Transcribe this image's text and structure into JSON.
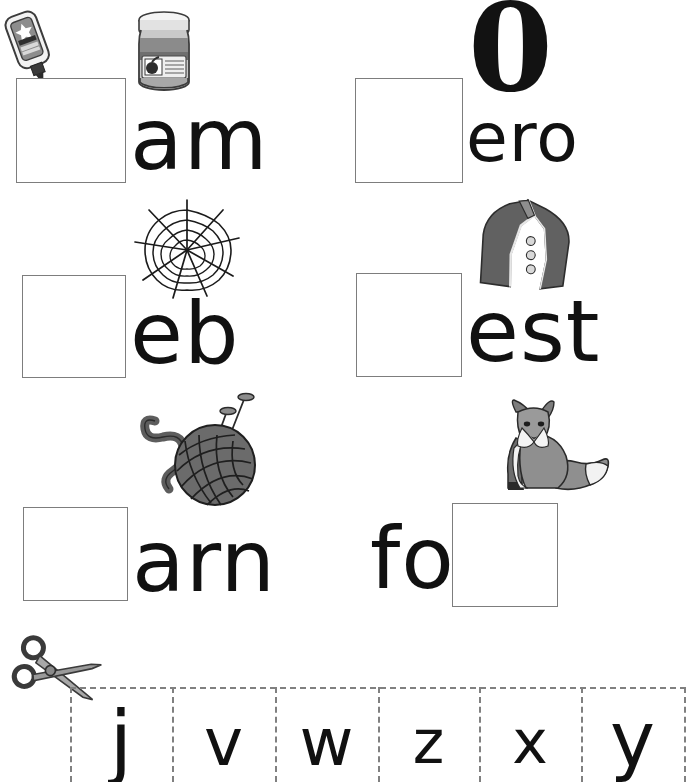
{
  "worksheet": {
    "title": "Beginning Sounds Cut and Paste Worksheet",
    "box_border_color": "#7d7d7d",
    "text_color": "#111111",
    "dash_color": "#808080"
  },
  "items": [
    {
      "id": "jam",
      "word_fragment": "am",
      "missing_letter": "j",
      "picture": "jam-jar",
      "second_picture": "glue-bottle",
      "box_position": "before"
    },
    {
      "id": "zero",
      "word_fragment": "ero",
      "missing_letter": "z",
      "picture": "number-zero",
      "big_glyph": "0",
      "box_position": "before"
    },
    {
      "id": "web",
      "word_fragment": "eb",
      "missing_letter": "w",
      "picture": "spider-web",
      "box_position": "before"
    },
    {
      "id": "vest",
      "word_fragment": "est",
      "missing_letter": "v",
      "picture": "vest",
      "box_position": "before"
    },
    {
      "id": "yarn",
      "word_fragment": "arn",
      "missing_letter": "y",
      "picture": "yarn-ball",
      "box_position": "before"
    },
    {
      "id": "fox",
      "word_fragment": "fo",
      "missing_letter": "x",
      "picture": "fox",
      "box_position": "after"
    }
  ],
  "cut_strip": {
    "scissors_icon": "scissors-icon",
    "letters": [
      "j",
      "v",
      "w",
      "z",
      "x",
      "y"
    ]
  }
}
